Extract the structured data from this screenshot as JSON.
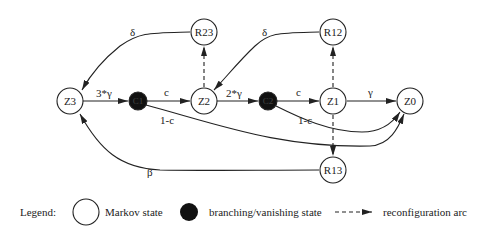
{
  "diagram": {
    "nodes": [
      {
        "id": "Z3",
        "label": "Z3",
        "type": "markov",
        "x": 70,
        "y": 101
      },
      {
        "id": "C1",
        "label": "C1",
        "type": "branching",
        "x": 138,
        "y": 101
      },
      {
        "id": "Z2",
        "label": "Z2",
        "type": "markov",
        "x": 204,
        "y": 101
      },
      {
        "id": "C2",
        "label": "C2",
        "type": "branching",
        "x": 268,
        "y": 101
      },
      {
        "id": "Z1",
        "label": "Z1",
        "type": "markov",
        "x": 333,
        "y": 101
      },
      {
        "id": "Z0",
        "label": "Z0",
        "type": "markov",
        "x": 410,
        "y": 101
      },
      {
        "id": "R23",
        "label": "R23",
        "type": "markov",
        "x": 204,
        "y": 32
      },
      {
        "id": "R12",
        "label": "R12",
        "type": "markov",
        "x": 333,
        "y": 32
      },
      {
        "id": "R13",
        "label": "R13",
        "type": "markov",
        "x": 333,
        "y": 170
      }
    ],
    "edges": [
      {
        "from": "Z3",
        "to": "C1",
        "label": "3*γ",
        "style": "solid"
      },
      {
        "from": "C1",
        "to": "Z2",
        "label": "c",
        "style": "solid"
      },
      {
        "from": "C1",
        "to": "Z0",
        "label": "1-c",
        "style": "solid"
      },
      {
        "from": "Z2",
        "to": "C2",
        "label": "2*γ",
        "style": "solid"
      },
      {
        "from": "C2",
        "to": "Z1",
        "label": "c",
        "style": "solid"
      },
      {
        "from": "C2",
        "to": "Z0",
        "label": "1-c",
        "style": "solid"
      },
      {
        "from": "Z1",
        "to": "Z0",
        "label": "γ",
        "style": "solid"
      },
      {
        "from": "R23",
        "to": "Z3",
        "label": "δ",
        "style": "solid"
      },
      {
        "from": "R12",
        "to": "Z2",
        "label": "δ",
        "style": "solid"
      },
      {
        "from": "R13",
        "to": "Z3",
        "label": "β",
        "style": "solid"
      },
      {
        "from": "Z2",
        "to": "R23",
        "label": "",
        "style": "dashed"
      },
      {
        "from": "Z1",
        "to": "R12",
        "label": "",
        "style": "dashed"
      },
      {
        "from": "Z1",
        "to": "R13",
        "label": "",
        "style": "dashed"
      }
    ],
    "edge_labels": {
      "z3_c1": "3*γ",
      "c1_z2": "c",
      "c1_z0": "1-c",
      "z2_c2": "2*γ",
      "c2_z1": "c",
      "c2_z0": "1-c",
      "z1_z0": "γ",
      "r23_z3": "δ",
      "r12_z2": "δ",
      "r13_z3": "β"
    },
    "node_labels": {
      "Z3": "Z3",
      "C1": "C1",
      "Z2": "Z2",
      "C2": "C2",
      "Z1": "Z1",
      "Z0": "Z0",
      "R23": "R23",
      "R12": "R12",
      "R13": "R13"
    }
  },
  "legend": {
    "title": "Legend:",
    "items": [
      {
        "symbol": "white-circle",
        "label": "Markov state"
      },
      {
        "symbol": "black-circle",
        "label": "branching/vanishing state"
      },
      {
        "symbol": "dashed-arrow",
        "label": "reconfiguration arc"
      }
    ]
  },
  "colors": {
    "stroke": "#222222",
    "background": "#ffffff",
    "branching_fill": "#111111"
  }
}
